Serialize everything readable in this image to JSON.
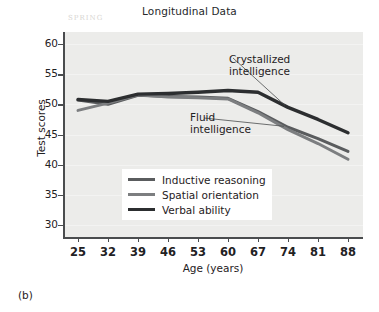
{
  "figure": {
    "caption": "(b)",
    "faint_watermark": "SPRING"
  },
  "chart_data": {
    "type": "line",
    "title": "Longitudinal Data",
    "xlabel": "Age (years)",
    "ylabel": "Test scores",
    "categories": [
      25,
      32,
      39,
      46,
      53,
      60,
      67,
      74,
      81,
      88
    ],
    "x_tick_labels": [
      "25",
      "32",
      "39",
      "46",
      "53",
      "60",
      "67",
      "74",
      "81",
      "88"
    ],
    "y_tick_labels": [
      "60",
      "55",
      "50",
      "45",
      "40",
      "35",
      "30"
    ],
    "y_ticks": [
      60,
      55,
      50,
      45,
      40,
      35,
      30
    ],
    "xlim": [
      21.5,
      91.5
    ],
    "ylim": [
      28,
      62
    ],
    "grid": true,
    "legend_position": "inside-bottom-left",
    "series": [
      {
        "name": "Inductive reasoning",
        "color": "#5a5c5e",
        "width": 3.0,
        "values": [
          50.7,
          50.0,
          51.5,
          51.3,
          51.2,
          51.0,
          48.8,
          46.2,
          44.3,
          42.2
        ]
      },
      {
        "name": "Spatial orientation",
        "color": "#7c7e80",
        "width": 3.0,
        "values": [
          49.0,
          50.2,
          51.6,
          51.2,
          51.1,
          50.9,
          48.6,
          45.8,
          43.5,
          40.9
        ]
      },
      {
        "name": "Verbal ability",
        "color": "#2c2e30",
        "width": 3.4,
        "values": [
          50.8,
          50.5,
          51.7,
          51.8,
          52.0,
          52.3,
          52.0,
          49.5,
          47.5,
          45.3
        ]
      }
    ],
    "annotations": [
      {
        "id": "crystallized",
        "line1": "Crystallized",
        "line2": "intelligence",
        "points_to_series": "Verbal ability"
      },
      {
        "id": "fluid",
        "line1": "Fluid",
        "line2": "intelligence",
        "points_to_series": "Inductive reasoning"
      }
    ]
  }
}
